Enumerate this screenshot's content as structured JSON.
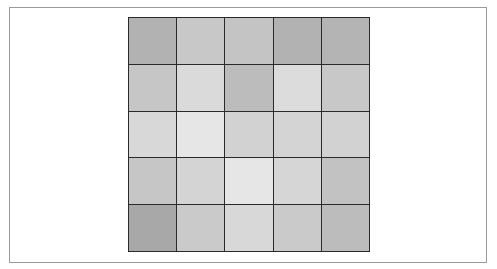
{
  "figure": {
    "type": "grayscale-grid",
    "rows": 5,
    "cols": 5,
    "border_color": "#2a2a2a",
    "frame_color": "#9a9a9a",
    "cells": [
      [
        "#b2b2b2",
        "#c8c8c8",
        "#c4c4c4",
        "#b2b2b2",
        "#b4b4b4"
      ],
      [
        "#c6c6c6",
        "#dadada",
        "#bcbcbc",
        "#dcdcdc",
        "#c8c8c8"
      ],
      [
        "#d8d8d8",
        "#e6e6e6",
        "#d2d2d2",
        "#d4d4d4",
        "#d2d2d2"
      ],
      [
        "#c6c6c6",
        "#d4d4d4",
        "#e6e6e6",
        "#d6d6d6",
        "#c2c2c2"
      ],
      [
        "#a8a8a8",
        "#cacaca",
        "#d8d8d8",
        "#cacaca",
        "#bcbcbc"
      ]
    ]
  }
}
